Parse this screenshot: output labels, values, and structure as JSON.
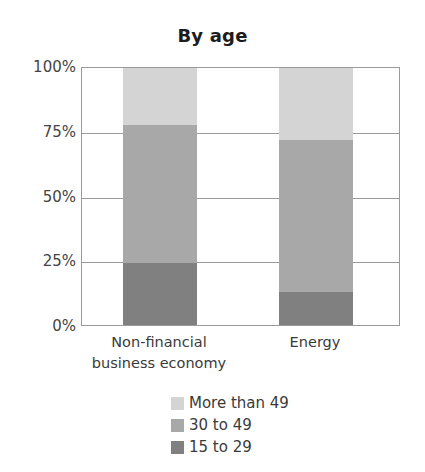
{
  "chart_data": {
    "type": "bar",
    "subtype": "stacked-percentage",
    "title": "By age",
    "xlabel": "",
    "ylabel": "",
    "ylim": [
      0,
      100
    ],
    "grid": true,
    "legend_position": "bottom",
    "categories": [
      "Non-financial business economy",
      "Energy"
    ],
    "category_lines": [
      [
        "Non-financial",
        "business economy"
      ],
      [
        "Energy"
      ]
    ],
    "ytick_labels": [
      "100%",
      "75%",
      "50%",
      "25%",
      "0%"
    ],
    "ytick_values": [
      100,
      75,
      50,
      25,
      0
    ],
    "series": [
      {
        "name": "More than 49",
        "color": "#d4d4d4",
        "values": [
          22,
          28
        ]
      },
      {
        "name": "30 to 49",
        "color": "#a8a8a8",
        "values": [
          54,
          59
        ]
      },
      {
        "name": "15 to 29",
        "color": "#808080",
        "values": [
          24,
          13
        ]
      }
    ],
    "legend_entries": [
      {
        "label": "More than 49",
        "color": "#d4d4d4"
      },
      {
        "label": "30 to 49",
        "color": "#a8a8a8"
      },
      {
        "label": "15 to 29",
        "color": "#808080"
      }
    ],
    "axis_color": "#9a9a9a",
    "background": "#ffffff"
  }
}
